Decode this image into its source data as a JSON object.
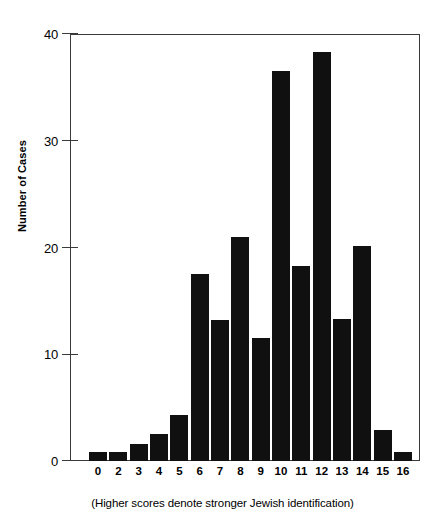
{
  "chart_data": {
    "type": "bar",
    "title": "",
    "subtitle": "",
    "xlabel": "(Higher scores denote stronger Jewish identification)",
    "ylabel": "Number of Cases",
    "categories": [
      "0",
      "2",
      "3",
      "4",
      "5",
      "6",
      "7",
      "8",
      "9",
      "10",
      "11",
      "12",
      "13",
      "14",
      "15",
      "16"
    ],
    "values": [
      0.8,
      0.8,
      1.6,
      2.5,
      4.3,
      17.5,
      13.2,
      21.0,
      11.5,
      36.5,
      18.3,
      38.3,
      13.3,
      20.1,
      2.9,
      0.8
    ],
    "ylim": [
      0,
      40
    ],
    "yticks": [
      0,
      10,
      20,
      30,
      40
    ],
    "ytick_labels": [
      "0",
      "10",
      "20",
      "30",
      "40"
    ],
    "grid": false,
    "legend": false,
    "bar_color": "#101010",
    "axis_color": "#3a3a3a",
    "background_color": "#ffffff"
  },
  "axes": {
    "y_title": "Number of Cases",
    "y_ticks": [
      "40",
      "30",
      "20",
      "10",
      "0"
    ]
  },
  "caption": {
    "text": "(Higher scores denote stronger Jewish identification)"
  }
}
